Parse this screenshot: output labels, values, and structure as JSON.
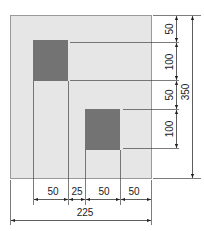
{
  "diagram": {
    "type": "dimensioned-plate-drawing",
    "colors": {
      "plate_fill": "#e6e6e6",
      "plate_stroke": "#9a9a9a",
      "square_fill": "#737373",
      "line": "#333333",
      "text": "#222222"
    },
    "plate": {
      "width_label": "225",
      "height_label": "350"
    },
    "squares": [
      {
        "name": "upper-left-square"
      },
      {
        "name": "lower-right-square"
      }
    ],
    "horizontal_dimensions": [
      {
        "label": "50"
      },
      {
        "label": "25"
      },
      {
        "label": "50"
      },
      {
        "label": "50"
      }
    ],
    "overall_width": {
      "label": "225"
    },
    "vertical_dimensions": [
      {
        "label": "50"
      },
      {
        "label": "100"
      },
      {
        "label": "50"
      },
      {
        "label": "100"
      }
    ],
    "overall_height": {
      "label": "350"
    }
  }
}
